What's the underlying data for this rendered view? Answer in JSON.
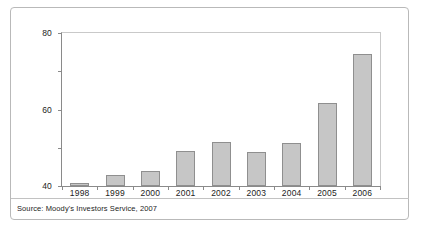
{
  "chart_data": {
    "type": "bar",
    "title": "",
    "subtitle": "",
    "xlabel": "",
    "ylabel": "",
    "categories": [
      "1998",
      "1999",
      "2000",
      "2001",
      "2002",
      "2003",
      "2004",
      "2005",
      "2006"
    ],
    "values": [
      1.5,
      6,
      8,
      18.5,
      23,
      18,
      22.5,
      43.5,
      69
    ],
    "ylim": [
      0,
      80
    ],
    "yticks": [
      0,
      20,
      40,
      60,
      80
    ],
    "ytick_labels": [
      "0",
      "20",
      "40",
      "60",
      "80"
    ],
    "grid": false,
    "legend": null,
    "legend_position": "none",
    "series": [
      {
        "name": "",
        "values": [
          1.5,
          6,
          8,
          18.5,
          23,
          18,
          22.5,
          43.5,
          69
        ]
      }
    ],
    "bar_color": "#c6c6c6",
    "bar_border_color": "#8f8f8f",
    "axis_color": "#8a8a8a"
  },
  "source_note": "Source: Moody's Investors Service, 2007",
  "figure_caption": ""
}
